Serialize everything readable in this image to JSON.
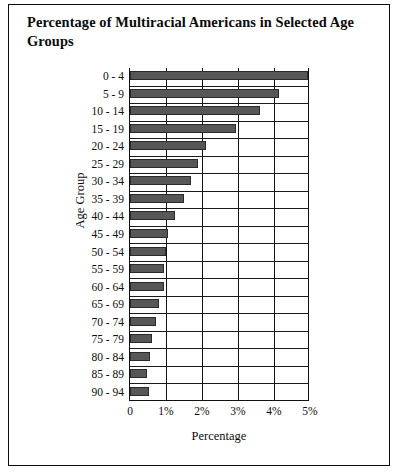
{
  "figure": {
    "title": "Percentage of Multiracial Americans in Selected Age Groups",
    "background_color": "#ffffff",
    "border_color": "#0b0b0b",
    "bar_color": "#575757"
  },
  "chart_data": {
    "type": "bar",
    "orientation": "horizontal",
    "title": "Percentage of Multiracial Americans in Selected Age Groups",
    "xlabel": "Percentage",
    "ylabel": "Age Group",
    "xlim": [
      0,
      5
    ],
    "xtick_labels": [
      "0",
      "1%",
      "2%",
      "3%",
      "4%",
      "5%"
    ],
    "xtick_values": [
      0,
      1,
      2,
      3,
      4,
      5
    ],
    "grid": "vertical",
    "legend": "none",
    "categories": [
      "0 - 4",
      "5 - 9",
      "10 - 14",
      "15 - 19",
      "20 - 24",
      "25 - 29",
      "30 - 34",
      "35 - 39",
      "40 - 44",
      "45 - 49",
      "50 - 54",
      "55 - 59",
      "60 - 64",
      "65 - 69",
      "70 - 74",
      "75 - 79",
      "80 - 84",
      "85 - 89",
      "90 - 94"
    ],
    "values": [
      4.95,
      4.15,
      3.6,
      2.95,
      2.1,
      1.9,
      1.7,
      1.5,
      1.25,
      1.05,
      1.0,
      0.95,
      0.95,
      0.8,
      0.72,
      0.62,
      0.55,
      0.48,
      0.52
    ],
    "value_unit": "%"
  }
}
